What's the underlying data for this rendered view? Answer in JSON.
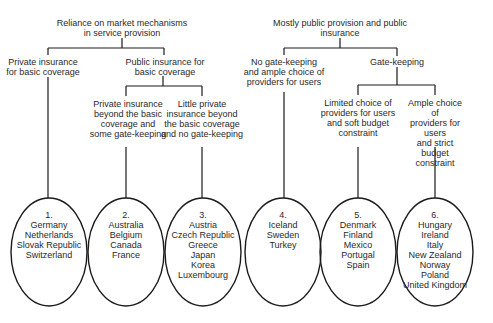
{
  "diagram": {
    "branches": [
      {
        "label": "Reliance on market mechanisms\nin service provision",
        "children": [
          {
            "label": "Private insurance\nfor basic coverage",
            "group": 0
          },
          {
            "label": "Public insurance for\nbasic coverage",
            "children": [
              {
                "label": "Private insurance\nbeyond the basic\ncoverage and\nsome gate-keeping",
                "group": 1
              },
              {
                "label": "Little private\ninsurance beyond\nthe basic coverage\nand no gate-keeping",
                "group": 2
              }
            ]
          }
        ]
      },
      {
        "label": "Mostly public provision and public\ninsurance",
        "children": [
          {
            "label": "No gate-keeping\nand ample choice of\nproviders for users",
            "group": 3
          },
          {
            "label": "Gate-keeping",
            "children": [
              {
                "label": "Limited choice of\nproviders for users\nand soft budget\nconstraint",
                "group": 4
              },
              {
                "label": "Ample choice of\nproviders for users\nand strict budget\nconstraint",
                "group": 5
              }
            ]
          }
        ]
      }
    ],
    "groups": [
      {
        "number": "1.",
        "countries": [
          "Germany",
          "Netherlands",
          "Slovak Republic",
          "Switzerland"
        ]
      },
      {
        "number": "2.",
        "countries": [
          "Australia",
          "Belgium",
          "Canada",
          "France"
        ]
      },
      {
        "number": "3.",
        "countries": [
          "Austria",
          "Czech Republic",
          "Greece",
          "Japan",
          "Korea",
          "Luxembourg"
        ]
      },
      {
        "number": "4.",
        "countries": [
          "Iceland",
          "Sweden",
          "Turkey"
        ]
      },
      {
        "number": "5.",
        "countries": [
          "Denmark",
          "Finland",
          "Mexico",
          "Portugal",
          "Spain"
        ]
      },
      {
        "number": "6.",
        "countries": [
          "Hungary",
          "Ireland",
          "Italy",
          "New Zealand",
          "Norway",
          "Poland",
          "United Kingdom"
        ]
      }
    ],
    "colors": {
      "line": "#1a1a1a",
      "text": "#2a2a2a",
      "background": "#ffffff"
    }
  }
}
